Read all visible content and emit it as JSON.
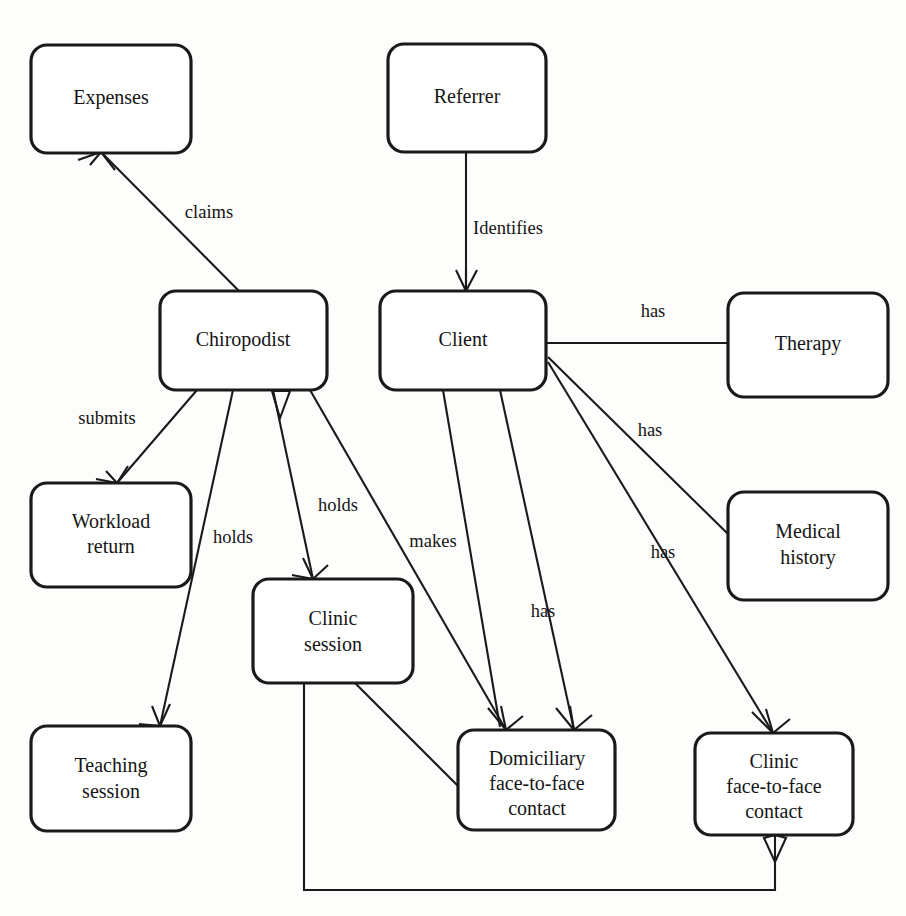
{
  "diagram": {
    "type": "entity-relationship",
    "background_color": "#fdfdfc",
    "line_color": "#1a1a1a",
    "entity_fill": "#ffffff",
    "entities": [
      {
        "id": "expenses",
        "label": "Expenses",
        "lines": [
          "Expenses"
        ],
        "x": 31,
        "y": 45,
        "w": 160,
        "h": 108
      },
      {
        "id": "referrer",
        "label": "Referrer",
        "lines": [
          "Referrer"
        ],
        "x": 388,
        "y": 44,
        "w": 158,
        "h": 108
      },
      {
        "id": "chiropodist",
        "label": "Chiropodist",
        "lines": [
          "Chiropodist"
        ],
        "x": 160,
        "y": 291,
        "w": 167,
        "h": 99
      },
      {
        "id": "client",
        "label": "Client",
        "lines": [
          "Client"
        ],
        "x": 380,
        "y": 291,
        "w": 166,
        "h": 99
      },
      {
        "id": "therapy",
        "label": "Therapy",
        "lines": [
          "Therapy"
        ],
        "x": 728,
        "y": 293,
        "w": 160,
        "h": 104
      },
      {
        "id": "workload",
        "label": "Workload return",
        "lines": [
          "Workload",
          "return"
        ],
        "x": 31,
        "y": 483,
        "w": 160,
        "h": 104
      },
      {
        "id": "medical",
        "label": "Medical history",
        "lines": [
          "Medical",
          "history"
        ],
        "x": 728,
        "y": 492,
        "w": 160,
        "h": 108
      },
      {
        "id": "clinicsess",
        "label": "Clinic session",
        "lines": [
          "Clinic",
          "session"
        ],
        "x": 253,
        "y": 579,
        "w": 160,
        "h": 104
      },
      {
        "id": "teaching",
        "label": "Teaching session",
        "lines": [
          "Teaching",
          "session"
        ],
        "x": 31,
        "y": 726,
        "w": 160,
        "h": 105
      },
      {
        "id": "domicil",
        "label": "Domiciliary face-to-face contact",
        "lines": [
          "Domiciliary",
          "face-to-face",
          "contact"
        ],
        "x": 458,
        "y": 730,
        "w": 157,
        "h": 100
      },
      {
        "id": "clinicf2f",
        "label": "Clinic face-to-face contact",
        "lines": [
          "Clinic",
          "face-to-face",
          "contact"
        ],
        "x": 695,
        "y": 733,
        "w": 158,
        "h": 102
      }
    ],
    "relationships": [
      {
        "id": "rel-claims",
        "label": "claims",
        "from": "chiropodist",
        "to": "expenses",
        "label_x": 209,
        "label_y": 214
      },
      {
        "id": "rel-identifies",
        "label": "Identifies",
        "from": "referrer",
        "to": "client",
        "label_x": 508,
        "label_y": 230
      },
      {
        "id": "rel-has-therapy",
        "label": "has",
        "from": "client",
        "to": "therapy",
        "label_x": 653,
        "label_y": 313
      },
      {
        "id": "rel-submits",
        "label": "submits",
        "from": "chiropodist",
        "to": "workload",
        "label_x": 107,
        "label_y": 420
      },
      {
        "id": "rel-has-medical",
        "label": "has",
        "from": "client",
        "to": "medical",
        "label_x": 650,
        "label_y": 432
      },
      {
        "id": "rel-holds-clinic",
        "label": "holds",
        "from": "chiropodist",
        "to": "clinicsess",
        "label_x": 338,
        "label_y": 507
      },
      {
        "id": "rel-holds-teach",
        "label": "holds",
        "from": "chiropodist",
        "to": "teaching",
        "label_x": 233,
        "label_y": 539
      },
      {
        "id": "rel-makes",
        "label": "makes",
        "from": "chiropodist",
        "to": "domicil",
        "label_x": 433,
        "label_y": 543
      },
      {
        "id": "rel-has-clinicf",
        "label": "has",
        "from": "client",
        "to": "clinicf2f",
        "label_x": 663,
        "label_y": 554
      },
      {
        "id": "rel-has-domicil",
        "label": "has",
        "from": "client",
        "to": "domicil",
        "label_x": 543,
        "label_y": 613
      }
    ],
    "unlabeled_relationships": [
      {
        "id": "rel-clinicsess-domicil",
        "from": "clinicsess",
        "to": "domicil"
      },
      {
        "id": "rel-clinicsess-clinicf2f",
        "from": "clinicsess",
        "to": "clinicf2f"
      }
    ]
  }
}
